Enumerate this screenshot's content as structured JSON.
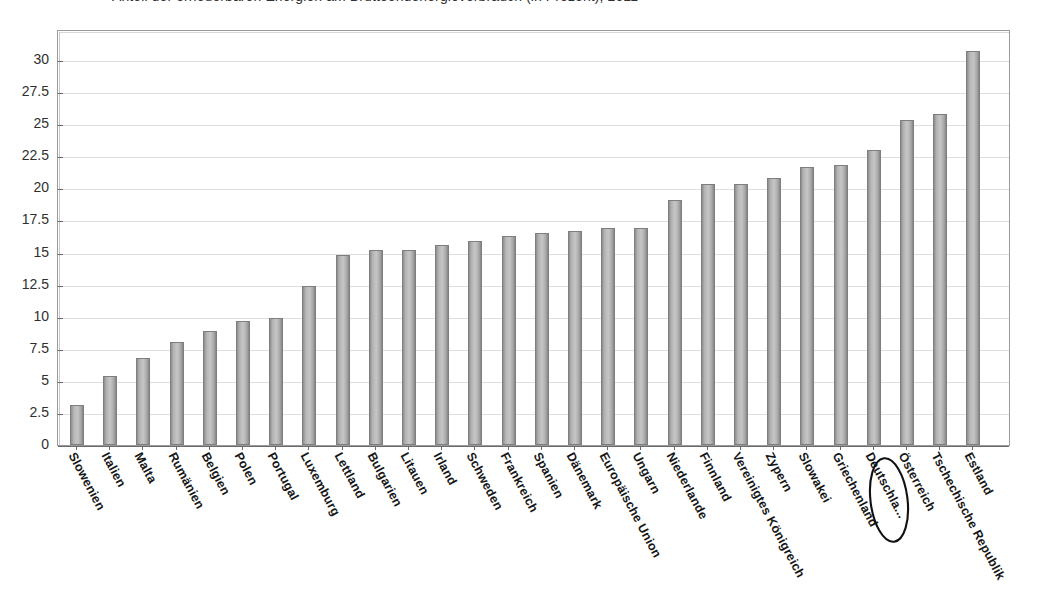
{
  "title": {
    "text": "Anteil der erneuerbaren Energien am Bruttoendenergieverbrauch (in Prozent), 2011",
    "visible_note": "cut-off at top edge"
  },
  "chart_data": {
    "type": "bar",
    "title": "Anteil der erneuerbaren Energien am Bruttoendenergieverbrauch (in Prozent), 2011",
    "xlabel": "",
    "ylabel": "",
    "ylim": [
      0,
      31.5
    ],
    "yticks": [
      0,
      2.5,
      5,
      7.5,
      10,
      12.5,
      15,
      17.5,
      20,
      22.5,
      25,
      27.5,
      30
    ],
    "ytick_labels": [
      "0",
      "2.5",
      "5",
      "7.5",
      "10",
      "12.5",
      "15",
      "17.5",
      "20",
      "22.5",
      "25",
      "27.5",
      "30"
    ],
    "grid": true,
    "legend": false,
    "bar_color": "#b4b4b4",
    "bar_edge_color": "#7e7e7e",
    "highlight": {
      "category": "Deutschla...",
      "style": "hand-drawn-ellipse"
    },
    "categories": [
      "Slowenien",
      "Italien",
      "Malta",
      "Rumänien",
      "Belgien",
      "Polen",
      "Portugal",
      "Luxemburg",
      "Lettland",
      "Bulgarien",
      "Litauen",
      "Irland",
      "Schweden",
      "Frankreich",
      "Spanien",
      "Dänemark",
      "Europäische Union",
      "Ungarn",
      "Niederlande",
      "Finnland",
      "Vereinigtes Königreich",
      "Zypern",
      "Slowakei",
      "Griechenland",
      "Deutschla...",
      "Österreich",
      "Tschechische Republik",
      "Estland"
    ],
    "values": [
      3.1,
      5.4,
      6.8,
      8.0,
      8.9,
      9.7,
      9.9,
      12.4,
      14.8,
      15.2,
      15.2,
      15.6,
      15.9,
      16.3,
      16.5,
      16.7,
      16.9,
      16.9,
      19.1,
      20.3,
      20.3,
      20.8,
      21.7,
      21.8,
      23.0,
      25.3,
      25.8,
      30.7
    ]
  }
}
